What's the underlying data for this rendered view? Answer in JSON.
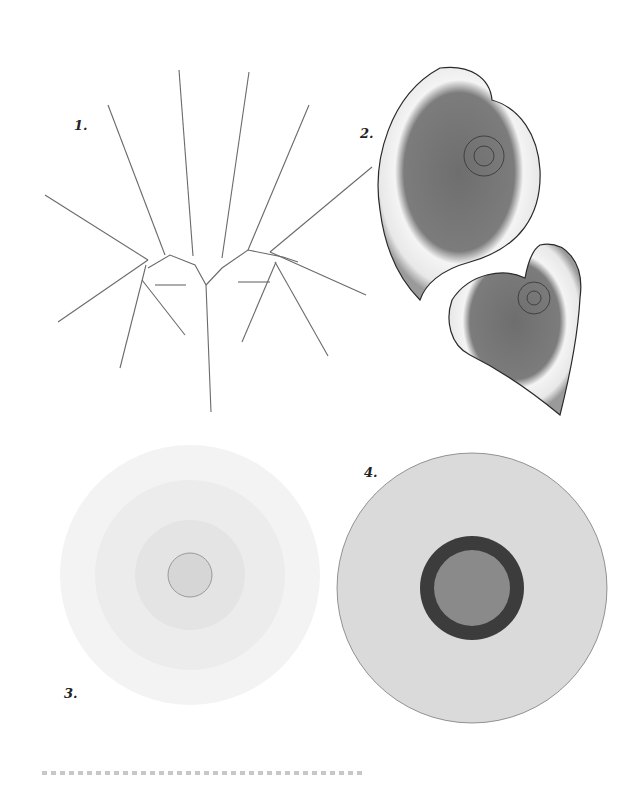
{
  "plate": {
    "background": "#ffffff",
    "figures": [
      {
        "label": "1.",
        "subject": "fern frond (Adiantum pedatum)",
        "style": "light grey line engraving"
      },
      {
        "label": "2.",
        "subject": "spiral begonia leaves",
        "style": "grey with white banding, dark veins"
      },
      {
        "label": "3.",
        "subject": "spiral succulent rosette (Aloe polyphylla)",
        "style": "fine pencil hatching"
      },
      {
        "label": "4.",
        "subject": "sunflower head",
        "style": "grey petals, dark seed disk"
      }
    ],
    "colors": {
      "ink": "#2a2a2a",
      "leaf_fill": "#7a7a7a",
      "leaf_band": "#f2f2f2",
      "fern_leaflet": "#d6d6d6",
      "petal": "#d9d9d9",
      "disk_ring": "#3c3c3c",
      "disk_center": "#8a8a8a"
    },
    "caption": ""
  }
}
